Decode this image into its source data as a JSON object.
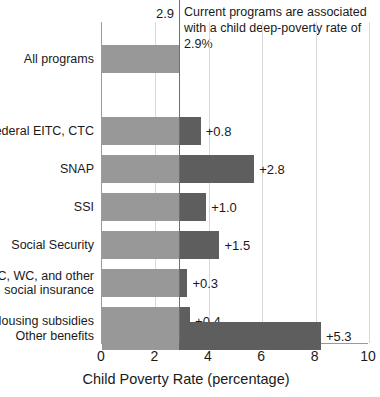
{
  "chart_data": {
    "type": "bar",
    "title": "",
    "subtitle": "",
    "xlabel": "Child Poverty Rate (percentage)",
    "ylabel": "",
    "xlim": [
      0,
      10
    ],
    "xticks": [
      0,
      2,
      4,
      6,
      8,
      10
    ],
    "xtick_labels": [
      "0",
      "2",
      "4",
      "6",
      "8",
      "10"
    ],
    "grid": "vertical",
    "legend": "none",
    "orientation": "horizontal",
    "baseline_value": 2.9,
    "baseline_label": "2.9",
    "annotation": "Current programs are associated with a child deep-poverty rate of 2.9%",
    "categories": [
      "All programs",
      "Federal EITC, CTC",
      "SNAP",
      "SSI",
      "Social Security",
      "UC, WC, and other\nsocial insurance",
      "Housing subsidies",
      "Other benefits"
    ],
    "bars": [
      {
        "label": "All programs",
        "base": 2.9,
        "increment": 0.0,
        "total": 2.9,
        "value_label": ""
      },
      {
        "label": "Federal EITC, CTC",
        "base": 2.9,
        "increment": 0.8,
        "total": 3.7,
        "value_label": "+0.8"
      },
      {
        "label": "SNAP",
        "base": 2.9,
        "increment": 2.8,
        "total": 5.7,
        "value_label": "+2.8"
      },
      {
        "label": "SSI",
        "base": 2.9,
        "increment": 1.0,
        "total": 3.9,
        "value_label": "+1.0"
      },
      {
        "label": "Social Security",
        "base": 2.9,
        "increment": 1.5,
        "total": 4.4,
        "value_label": "+1.5"
      },
      {
        "label": "UC, WC, and other\nsocial insurance",
        "base": 2.9,
        "increment": 0.3,
        "total": 3.2,
        "value_label": "+0.3"
      },
      {
        "label": "Housing subsidies",
        "base": 2.9,
        "increment": 0.4,
        "total": 3.3,
        "value_label": "+0.4"
      },
      {
        "label": "Other benefits",
        "base": 2.9,
        "increment": 5.3,
        "total": 8.2,
        "value_label": "+5.3"
      }
    ],
    "colors": {
      "base_bar": "#989898",
      "increment_bar": "#5e5e5e",
      "gridline": "#d8d8d8",
      "axis": "#9a9a9a",
      "reference_line": "#6f6f6f",
      "text": "#1a1a1a",
      "background": "#ffffff"
    }
  }
}
